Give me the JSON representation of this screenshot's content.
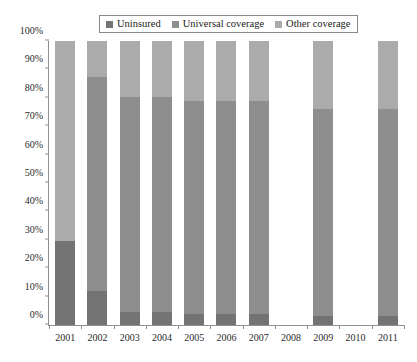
{
  "legend": {
    "position": "top-center",
    "items": [
      {
        "label": "Uninsured",
        "color": "#737373",
        "key": "uninsured"
      },
      {
        "label": "Universal coverage",
        "color": "#8e8e8e",
        "key": "universal"
      },
      {
        "label": "Other coverage",
        "color": "#ababab",
        "key": "other"
      }
    ]
  },
  "axes": {
    "y_ticks": [
      "0%",
      "10%",
      "20%",
      "30%",
      "40%",
      "50%",
      "60%",
      "70%",
      "80%",
      "90%",
      "100%"
    ],
    "y_values": [
      0,
      10,
      20,
      30,
      40,
      50,
      60,
      70,
      80,
      90,
      100
    ],
    "x_ticks": [
      "2001",
      "2002",
      "2003",
      "2004",
      "2005",
      "2006",
      "2007",
      "2008",
      "2009",
      "2010",
      "2011"
    ]
  },
  "chart_data": {
    "type": "bar",
    "subtype": "stacked-bar-100-percent",
    "title": "",
    "subtitle": "",
    "xlabel": "",
    "ylabel": "",
    "ylim": [
      0,
      100
    ],
    "grid": false,
    "legend_position": "top-center",
    "categories": [
      "2001",
      "2002",
      "2003",
      "2004",
      "2005",
      "2006",
      "2007",
      "2008",
      "2009",
      "2010",
      "2011"
    ],
    "series": [
      {
        "name": "Uninsured",
        "color": "#737373",
        "values": [
          29.5,
          12.0,
          4.5,
          4.5,
          4.0,
          4.0,
          4.0,
          null,
          3.0,
          null,
          3.0
        ]
      },
      {
        "name": "Universal coverage",
        "color": "#8e8e8e",
        "values": [
          0.0,
          75.3,
          75.8,
          75.8,
          74.9,
          74.9,
          74.9,
          null,
          73.0,
          null,
          73.0
        ]
      },
      {
        "name": "Other coverage",
        "color": "#ababab",
        "values": [
          70.5,
          12.7,
          19.7,
          19.7,
          21.1,
          21.1,
          21.1,
          null,
          24.0,
          null,
          24.0
        ]
      }
    ],
    "missing_categories": [
      "2008",
      "2010"
    ]
  }
}
